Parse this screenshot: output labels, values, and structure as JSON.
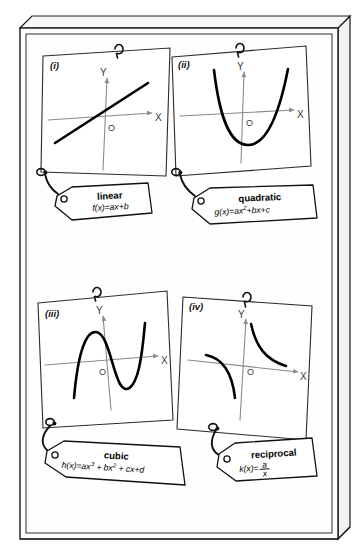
{
  "board": {
    "name": "function-types-pinboard",
    "background_color": "#fefefe",
    "edge_color": "#1a1a1a",
    "face_color": "#ffffff"
  },
  "palette": {
    "ink": "#111111",
    "curve": "#000000",
    "axis": "#8a8a8a",
    "card_edge": "#2b2b2b",
    "tag_fill": "#ffffff",
    "string": "#111111"
  },
  "cards": [
    {
      "id": "card-linear",
      "numeral": "(i)",
      "axis_labels": {
        "x": "X",
        "y": "Y",
        "origin": "O"
      },
      "graph": "straight-line-positive-slope",
      "tag": {
        "title": "linear",
        "formula_plain": "f(x)=ax+b",
        "formula_parts": [
          {
            "text": "f(x)=ax+b",
            "type": "base"
          }
        ]
      }
    },
    {
      "id": "card-quadratic",
      "numeral": "(ii)",
      "axis_labels": {
        "x": "X",
        "y": "Y",
        "origin": "O"
      },
      "graph": "upward-parabola",
      "tag": {
        "title": "quadratic",
        "formula_plain": "g(x)=ax2+bx+c",
        "formula_parts": [
          {
            "text": "g(x)=ax",
            "type": "base"
          },
          {
            "text": "2",
            "type": "sup"
          },
          {
            "text": "+bx+c",
            "type": "base"
          }
        ]
      }
    },
    {
      "id": "card-cubic",
      "numeral": "(iii)",
      "axis_labels": {
        "x": "X",
        "y": "Y",
        "origin": "O"
      },
      "graph": "cubic-with-local-max-and-min",
      "tag": {
        "title": "cubic",
        "formula_plain": "h(x)=ax3 + bx2 + cx+d",
        "formula_parts": [
          {
            "text": "h(x)=ax",
            "type": "base"
          },
          {
            "text": "3",
            "type": "sup"
          },
          {
            "text": " + bx",
            "type": "base"
          },
          {
            "text": "2",
            "type": "sup"
          },
          {
            "text": " + cx+d",
            "type": "base"
          }
        ]
      }
    },
    {
      "id": "card-reciprocal",
      "numeral": "(iv)",
      "axis_labels": {
        "x": "X",
        "y": "Y",
        "origin": "O"
      },
      "graph": "hyperbola-two-branches",
      "tag": {
        "title": "reciprocal",
        "formula_plain": "k(x)= a/x",
        "fraction": {
          "lead": "k(x)=",
          "numerator": "a",
          "denominator": "x"
        }
      }
    }
  ],
  "icons": {
    "pin": "loop-pin-icon",
    "eyelet": "tag-eyelet-icon",
    "string": "string-icon"
  }
}
